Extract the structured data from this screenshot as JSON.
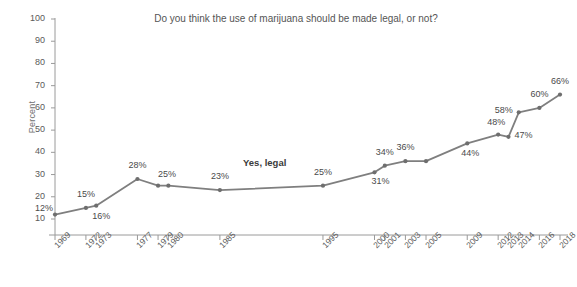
{
  "chart_data": {
    "type": "line",
    "title": "Do you think the use of marijuana should be made legal, or not?",
    "xlabel": "",
    "ylabel": "Percent",
    "ylim": [
      10,
      100
    ],
    "xlim": [
      1969,
      2018
    ],
    "yticks": [
      10,
      20,
      30,
      40,
      50,
      60,
      70,
      80,
      90,
      100
    ],
    "grid": false,
    "legend_position": "inline",
    "series": [
      {
        "name": "Yes, legal",
        "x": [
          1969,
          1972,
          1973,
          1977,
          1979,
          1980,
          1985,
          1995,
          2000,
          2001,
          2003,
          2005,
          2009,
          2012,
          2013,
          2014,
          2016,
          2018
        ],
        "values": [
          12,
          15,
          16,
          28,
          25,
          25,
          23,
          25,
          31,
          34,
          36,
          36,
          44,
          48,
          47,
          58,
          60,
          66
        ],
        "point_labels": [
          "12%",
          "15%",
          "16%",
          "28%",
          "25%",
          "",
          "23%",
          "25%",
          "31%",
          "34%",
          "36%",
          "",
          "44%",
          "48%",
          "47%",
          "58%",
          "60%",
          "66%"
        ]
      }
    ],
    "x_tick_labels": [
      "1969",
      "1972",
      "1973",
      "1977",
      "1979",
      "1980",
      "1985",
      "1995",
      "2000",
      "2001",
      "2003",
      "2005",
      "2009",
      "2012",
      "2013",
      "2014",
      "2016",
      "2018"
    ],
    "x_tick_values": [
      1969,
      1972,
      1973,
      1977,
      1979,
      1980,
      1985,
      1995,
      2000,
      2001,
      2003,
      2005,
      2009,
      2012,
      2013,
      2014,
      2016,
      2018
    ],
    "colors": {
      "line": "#7f7f7f",
      "marker": "#6e6e6e",
      "axis": "#9a9a9a",
      "label_text": "#4a4a4a",
      "title_text": "#555555",
      "background": "#ffffff"
    }
  },
  "series_label": {
    "text": "Yes, legal"
  }
}
